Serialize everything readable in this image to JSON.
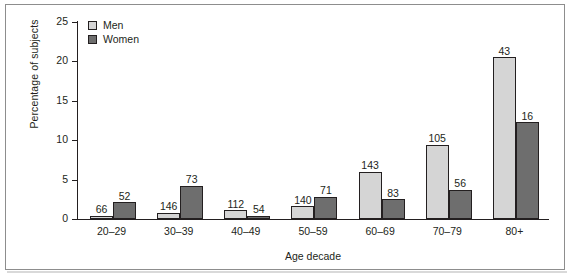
{
  "chart_data": {
    "type": "bar",
    "title": "",
    "xlabel": "Age decade",
    "ylabel": "Percentage of subjects",
    "categories": [
      "20–29",
      "30–39",
      "40–49",
      "50–59",
      "60–69",
      "70–79",
      "80+"
    ],
    "ylim": [
      0,
      25
    ],
    "yticks": [
      0,
      5,
      10,
      15,
      20,
      25
    ],
    "ytick_labels": [
      "0",
      "5",
      "10",
      "15",
      "20",
      "25"
    ],
    "grid": false,
    "legend_position": "top-left",
    "series": [
      {
        "name": "Men",
        "color": "#d5d5d5",
        "values": [
          0.4,
          0.8,
          1.1,
          1.6,
          6.0,
          9.4,
          20.5
        ],
        "point_labels": [
          "66",
          "146",
          "112",
          "140",
          "143",
          "105",
          "43"
        ]
      },
      {
        "name": "Women",
        "color": "#6e6e6e",
        "values": [
          2.1,
          4.2,
          0.35,
          2.8,
          2.5,
          3.7,
          12.3
        ],
        "point_labels": [
          "52",
          "73",
          "54",
          "71",
          "83",
          "56",
          "16"
        ]
      }
    ]
  },
  "legend": {
    "items": [
      {
        "label": "Men",
        "swatch": "men-swatch"
      },
      {
        "label": "Women",
        "swatch": "women-swatch"
      }
    ]
  }
}
